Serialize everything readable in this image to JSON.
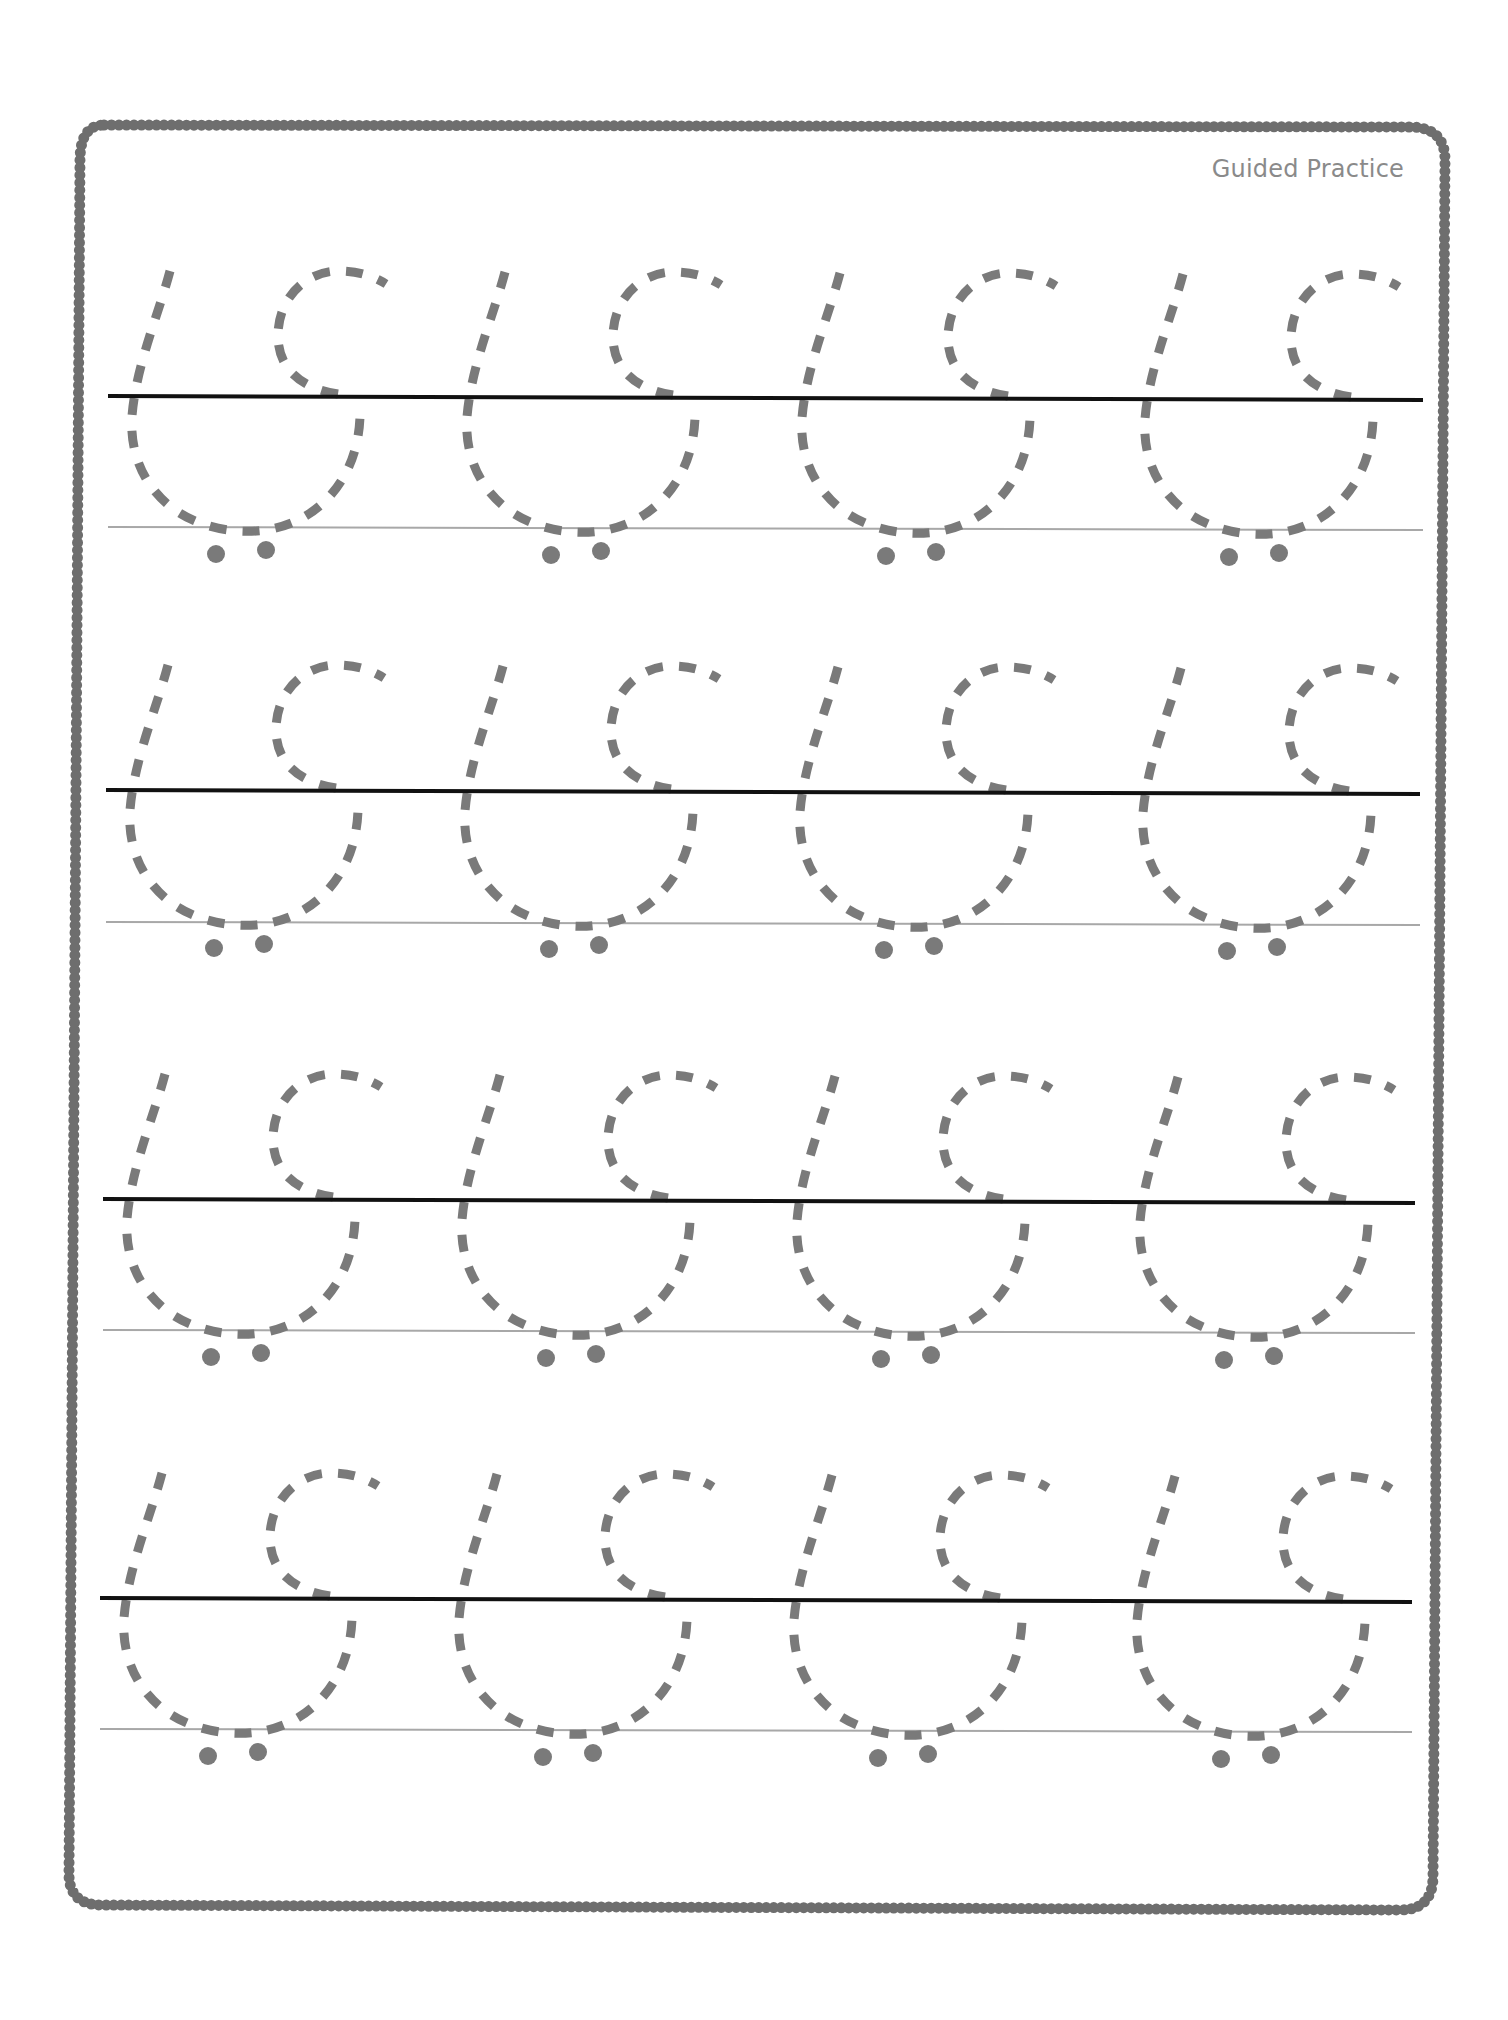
{
  "worksheet": {
    "title": "Guided Practice",
    "colors": {
      "border": "#6e6e6e",
      "midline": "#111111",
      "baseline": "#a8a8a8",
      "trace": "#7a7a7a",
      "label": "#8a8a8a",
      "background": "#ffffff"
    },
    "rows": [
      {
        "index": 1,
        "midline_y": 396,
        "baseline_y": 527,
        "x_start": 108,
        "x_end": 1423,
        "glyph_count": 4
      },
      {
        "index": 2,
        "midline_y": 790,
        "baseline_y": 922,
        "x_start": 106,
        "x_end": 1420,
        "glyph_count": 4
      },
      {
        "index": 3,
        "midline_y": 1199,
        "baseline_y": 1330,
        "x_start": 103,
        "x_end": 1415,
        "glyph_count": 4
      },
      {
        "index": 4,
        "midline_y": 1598,
        "baseline_y": 1729,
        "x_start": 100,
        "x_end": 1412,
        "glyph_count": 4
      }
    ],
    "glyph": {
      "description": "dashed tracing shape with two dots below",
      "dots_per_glyph": 2
    }
  }
}
